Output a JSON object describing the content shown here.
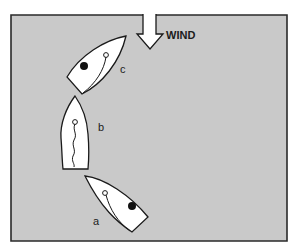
{
  "diagram": {
    "wind_label": "WIND",
    "boats": [
      {
        "id": "a",
        "label": "a"
      },
      {
        "id": "b",
        "label": "b"
      },
      {
        "id": "c",
        "label": "c"
      }
    ]
  },
  "colors": {
    "background": "#c9c9c9",
    "frame": "#2a2a2a",
    "boat_fill": "#ffffff",
    "stroke": "#1a1a1a"
  }
}
